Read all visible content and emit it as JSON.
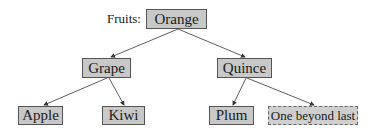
{
  "diagram": {
    "label": "Fruits:",
    "nodes": {
      "root": {
        "text": "Orange"
      },
      "left": {
        "text": "Grape"
      },
      "right": {
        "text": "Quince"
      },
      "left_left": {
        "text": "Apple"
      },
      "left_right": {
        "text": "Kiwi"
      },
      "right_left": {
        "text": "Plum"
      },
      "right_right": {
        "text": "One beyond last",
        "style": "dashed"
      }
    },
    "edges": [
      [
        "Orange",
        "Grape"
      ],
      [
        "Orange",
        "Quince"
      ],
      [
        "Grape",
        "Apple"
      ],
      [
        "Grape",
        "Kiwi"
      ],
      [
        "Quince",
        "Plum"
      ],
      [
        "Quince",
        "One beyond last"
      ]
    ],
    "colors": {
      "node_fill": "#c8c8c8",
      "node_border": "#555555",
      "edge": "#333333"
    }
  }
}
